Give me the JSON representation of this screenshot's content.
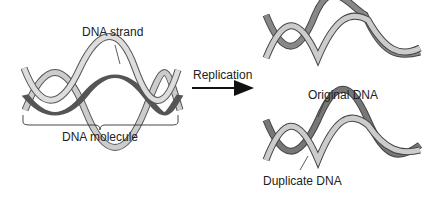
{
  "labels": {
    "dna_strand": "DNA strand",
    "dna_molecule": "DNA molecule",
    "replication": "Replication",
    "original_dna": "Original DNA",
    "duplicate_dna": "Duplicate DNA"
  },
  "colors": {
    "light_strand": "#c8c8c8",
    "dark_strand": "#7a7a7a",
    "outline": "#555555",
    "arrow": "#111111"
  }
}
